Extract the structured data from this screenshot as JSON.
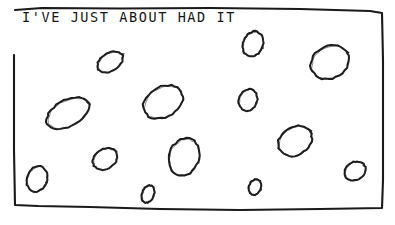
{
  "panel": {
    "caption": "I'VE JUST ABOUT HAD IT",
    "background_color": "#ffffff",
    "ink_color": "#1a1a1a",
    "border": {
      "name": "hand-drawn-rectangle",
      "points": "15,10 42,8 120,8.5 210,8 300,9 370,11 382,13 383,60 383,120 383,180 382,208 320,209 240,210 160,209 90,207 38,206 15,205 14,150 14,100 14,55"
    },
    "holes": [
      {
        "id": "hole-1",
        "cx": 110,
        "cy": 62,
        "rx": 14,
        "ry": 9,
        "rot": -32,
        "size": "small"
      },
      {
        "id": "hole-2",
        "cx": 253,
        "cy": 44,
        "rx": 10,
        "ry": 13,
        "rot": 22,
        "size": "small"
      },
      {
        "id": "hole-3",
        "cx": 330,
        "cy": 62,
        "rx": 20,
        "ry": 16,
        "rot": -28,
        "size": "large"
      },
      {
        "id": "hole-4",
        "cx": 68,
        "cy": 113,
        "rx": 23,
        "ry": 13,
        "rot": -28,
        "size": "large"
      },
      {
        "id": "hole-5",
        "cx": 163,
        "cy": 102,
        "rx": 21,
        "ry": 15,
        "rot": -30,
        "size": "large"
      },
      {
        "id": "hole-6",
        "cx": 248,
        "cy": 100,
        "rx": 9,
        "ry": 11,
        "rot": 20,
        "size": "small"
      },
      {
        "id": "hole-7",
        "cx": 295,
        "cy": 141,
        "rx": 18,
        "ry": 14,
        "rot": -32,
        "size": "large"
      },
      {
        "id": "hole-8",
        "cx": 184,
        "cy": 157,
        "rx": 15,
        "ry": 19,
        "rot": 20,
        "size": "medium"
      },
      {
        "id": "hole-9",
        "cx": 105,
        "cy": 159,
        "rx": 13,
        "ry": 10,
        "rot": -32,
        "size": "small"
      },
      {
        "id": "hole-10",
        "cx": 37,
        "cy": 179,
        "rx": 10,
        "ry": 13,
        "rot": 20,
        "size": "small"
      },
      {
        "id": "hole-11",
        "cx": 355,
        "cy": 171,
        "rx": 11,
        "ry": 9,
        "rot": -30,
        "size": "small"
      },
      {
        "id": "hole-12",
        "cx": 148,
        "cy": 194,
        "rx": 6,
        "ry": 9,
        "rot": 20,
        "size": "tiny"
      },
      {
        "id": "hole-13",
        "cx": 255,
        "cy": 187,
        "rx": 6,
        "ry": 8,
        "rot": 20,
        "size": "tiny"
      }
    ],
    "hole_count": 13
  }
}
